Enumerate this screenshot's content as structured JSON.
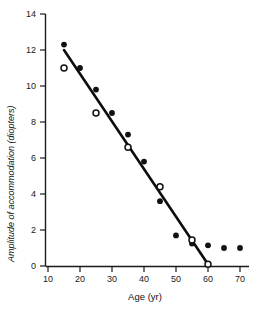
{
  "chart_data": {
    "type": "scatter",
    "title": "",
    "xlabel": "Age (yr)",
    "ylabel": "Amplitude of accommodation (diopters)",
    "xlim": [
      10,
      72
    ],
    "ylim": [
      0,
      14
    ],
    "xticks": [
      10,
      20,
      30,
      40,
      50,
      60,
      70
    ],
    "yticks": [
      0,
      2,
      4,
      6,
      8,
      10,
      12,
      14
    ],
    "xtick_labels": [
      "10",
      "20",
      "30",
      "40",
      "50",
      "60",
      "70"
    ],
    "ytick_labels": [
      "0",
      "2",
      "4",
      "6",
      "8",
      "10",
      "12",
      "14"
    ],
    "grid": false,
    "legend": "none",
    "series": [
      {
        "name": "filled",
        "marker": "filled-circle",
        "points": [
          {
            "x": 15,
            "y": 12.3
          },
          {
            "x": 20,
            "y": 11.0
          },
          {
            "x": 25,
            "y": 9.8
          },
          {
            "x": 30,
            "y": 8.5
          },
          {
            "x": 35,
            "y": 7.3
          },
          {
            "x": 40,
            "y": 5.8
          },
          {
            "x": 45,
            "y": 3.6
          },
          {
            "x": 50,
            "y": 1.7
          },
          {
            "x": 55,
            "y": 1.25
          },
          {
            "x": 60,
            "y": 1.15
          },
          {
            "x": 65,
            "y": 1.0
          },
          {
            "x": 70,
            "y": 1.0
          }
        ]
      },
      {
        "name": "open",
        "marker": "open-circle",
        "points": [
          {
            "x": 15,
            "y": 11.0
          },
          {
            "x": 25,
            "y": 8.5
          },
          {
            "x": 35,
            "y": 6.6
          },
          {
            "x": 45,
            "y": 4.4
          },
          {
            "x": 55,
            "y": 1.45
          },
          {
            "x": 60,
            "y": 0.1
          }
        ]
      }
    ],
    "fit_line": {
      "name": "trend-line",
      "start": {
        "x": 15,
        "y": 12.0
      },
      "end": {
        "x": 60,
        "y": 0.1
      }
    }
  }
}
